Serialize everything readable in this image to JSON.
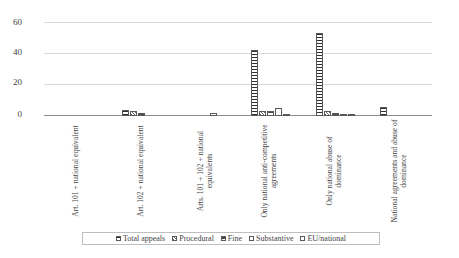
{
  "chart_data": {
    "type": "bar",
    "title": "",
    "xlabel": "",
    "ylabel": "",
    "ylim": [
      0,
      60
    ],
    "yticks": [
      0,
      20,
      40,
      60
    ],
    "grid": true,
    "legend_position": "bottom",
    "categories": [
      "Art. 101 + national equivalent",
      "Art. 102 + national equivalent",
      "Arts. 101 + 102 + national equivalents",
      "Only national anti-competitive agreements",
      "Only national abuse of dominance",
      "National agreements and abuse of dominance"
    ],
    "series": [
      {
        "name": "Total appeals",
        "pattern": "horizontal-stripes",
        "values": [
          0,
          4,
          0,
          42,
          53,
          6
        ]
      },
      {
        "name": "Procedural",
        "pattern": "diagonal-hatch",
        "values": [
          0,
          3,
          0,
          3,
          3,
          0
        ]
      },
      {
        "name": "Fine",
        "pattern": "dense-hatch",
        "values": [
          0,
          2,
          0,
          3,
          2,
          0
        ]
      },
      {
        "name": "Substantive",
        "pattern": "dotted",
        "values": [
          0,
          0,
          2,
          5,
          1,
          0
        ]
      },
      {
        "name": "EU/national",
        "pattern": "solid-black",
        "values": [
          0,
          0,
          0,
          1,
          1,
          0
        ]
      }
    ]
  },
  "axis": {
    "tick_labels": [
      "60",
      "40",
      "20",
      "0"
    ]
  },
  "legend": {
    "items": [
      {
        "label": "Total appeals"
      },
      {
        "label": "Procedural"
      },
      {
        "label": "Fine"
      },
      {
        "label": "Substantive"
      },
      {
        "label": "EU/national"
      }
    ]
  }
}
